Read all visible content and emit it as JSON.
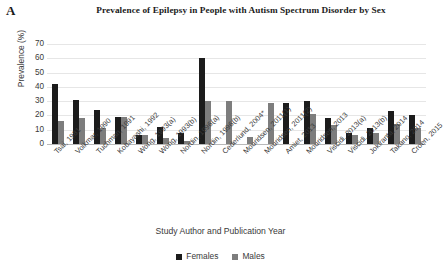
{
  "panel": {
    "letter": "A"
  },
  "axis_title_y": "Prevalence (%)",
  "axis_title_x": "Study Author and Publication Year",
  "legend": {
    "females_label": "Females",
    "males_label": "Males",
    "females_color": "#1c1c1c",
    "males_color": "#7d7d7d"
  },
  "chart_data": {
    "type": "bar",
    "title": "Prevalence of Epilepsy in People with Autism Spectrum Disorder by Sex",
    "xlabel": "Study Author and Publication Year",
    "ylabel": "Prevalence (%)",
    "ylim": [
      0,
      70
    ],
    "yticks": [
      0,
      10,
      20,
      30,
      40,
      50,
      60,
      70
    ],
    "grid": true,
    "legend_position": "bottom",
    "categories": [
      "Tsai, 1981",
      "Volkmar, 1990",
      "Tuchman, 1991",
      "Kobayashi, 1992",
      "Wong, 1993(a)",
      "Wong, 1993(b)",
      "Nordin, 1996(a)",
      "Nordin, 1996(b)",
      "Cederlund, 2004*",
      "Mouridsen, 2011(1)",
      "Mouridsen, 2011(2)",
      "Amiet, 2013",
      "Mouridsen, 2013",
      "Viscidi, 2013(a)",
      "Viscidi, 2013(b)",
      "Jokiranta, 2014",
      "Takano, 2014",
      "Croen, 2015"
    ],
    "series": [
      {
        "name": "Females",
        "color": "#1c1c1c",
        "values": [
          42,
          31,
          24,
          19,
          6,
          12,
          8,
          60,
          0,
          0,
          0,
          29,
          30,
          18,
          8,
          11,
          23,
          20
        ]
      },
      {
        "name": "Males",
        "color": "#7d7d7d",
        "values": [
          16,
          18,
          11,
          19,
          6,
          4,
          2,
          30,
          30,
          5,
          29,
          0,
          21,
          13,
          6,
          8,
          14,
          11
        ]
      }
    ]
  }
}
